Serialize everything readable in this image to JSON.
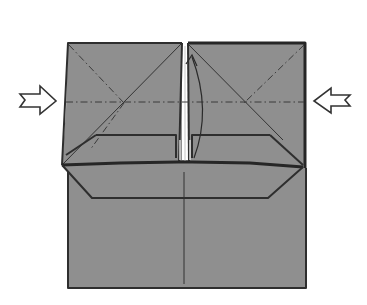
{
  "diagram": {
    "type": "origami-step",
    "colors": {
      "paper": "#8f8f8f",
      "line": "#2e2e2e",
      "background": "#ffffff",
      "arrow_fill": "#ffffff"
    },
    "symbols": [
      {
        "name": "push-arrow-left",
        "direction": "right"
      },
      {
        "name": "push-arrow-right",
        "direction": "left"
      },
      {
        "name": "fold-up-arrow",
        "direction": "up"
      }
    ],
    "lines": {
      "valley_fold": "horizontal dashed line across both flaps",
      "mountain_folds": "dash-dot diagonals from outer top corners",
      "center_crease": "vertical line down lower half"
    }
  }
}
